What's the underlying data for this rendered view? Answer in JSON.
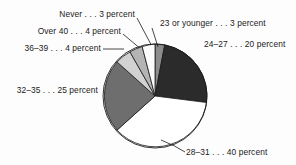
{
  "chart_data": {
    "type": "pie",
    "title": "",
    "subtitle": "",
    "xlabel": "",
    "ylabel": "",
    "legend_position": "callout-labels",
    "grid": false,
    "unit": "percent",
    "categories": [
      "23 or younger",
      "24–27",
      "28–31",
      "32–35",
      "36–39",
      "Over 40",
      "Never"
    ],
    "values": [
      3,
      20,
      40,
      25,
      4,
      4,
      3
    ],
    "labels": [
      "23 or younger . . . 3 percent",
      "24–27 . . . 20 percent",
      "28–31 . . . 40 percent",
      "32–35 . . . 25 percent",
      "36–39 . . . 4 percent",
      "Over 40 . . . 4 percent",
      "Never . . . 3 percent"
    ],
    "colors": [
      "#8c8c8c",
      "#2b2b2b",
      "#ffffff",
      "#6e6e6e",
      "#d2d2d2",
      "#b4b4b4",
      "#fbfbfb"
    ]
  },
  "slices": {
    "s23_younger": {
      "label": "23 or younger . . . 3 percent",
      "value": 3,
      "color": "#8c8c8c"
    },
    "s24_27": {
      "label": "24–27 . . . 20 percent",
      "value": 20,
      "color": "#2b2b2b"
    },
    "s28_31": {
      "label": "28–31 . . . 40 percent",
      "value": 40,
      "color": "#ffffff"
    },
    "s32_35": {
      "label": "32–35 . . . 25 percent",
      "value": 25,
      "color": "#6e6e6e"
    },
    "s36_39": {
      "label": "36–39 . . . 4 percent",
      "value": 4,
      "color": "#d2d2d2"
    },
    "sover40": {
      "label": "Over 40 . . . 4 percent",
      "value": 4,
      "color": "#b4b4b4"
    },
    "snever": {
      "label": "Never . . . 3 percent",
      "value": 3,
      "color": "#fbfbfb"
    }
  },
  "style": {
    "outline": "#1b1b1b",
    "background": "#fdfdfd",
    "text": "#1b1b1b"
  }
}
